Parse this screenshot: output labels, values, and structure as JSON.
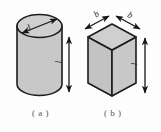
{
  "figure": {
    "background_color": "#fdfdfd",
    "fill_color": "#c8c8c8",
    "fill_color_dark": "#b9b9b9",
    "fill_color_light": "#cfcfcf",
    "outline_color": "#1c1c1c",
    "label_color": "#2b2b2b",
    "caption_color": "#555758",
    "panels": [
      {
        "id": "panel-a",
        "caption": "( a )",
        "shape": "cylinder",
        "dimensions": [
          {
            "name": "diameter",
            "symbol": "d",
            "orientation": "diagonal-top"
          },
          {
            "name": "length",
            "symbol": "l",
            "orientation": "vertical-right"
          }
        ]
      },
      {
        "id": "panel-b",
        "caption": "( b )",
        "shape": "rectangular-prism",
        "dimensions": [
          {
            "name": "width-left",
            "symbol": "b",
            "orientation": "diagonal-top-left"
          },
          {
            "name": "width-right",
            "symbol": "b",
            "orientation": "diagonal-top-right"
          },
          {
            "name": "length",
            "symbol": "l",
            "orientation": "vertical-right"
          }
        ]
      }
    ],
    "labels": {
      "d": "d",
      "l_a": "l",
      "b_left": "b",
      "b_right": "b",
      "l_b": "l"
    },
    "captions": {
      "a": "( a )",
      "b": "( b )"
    }
  }
}
